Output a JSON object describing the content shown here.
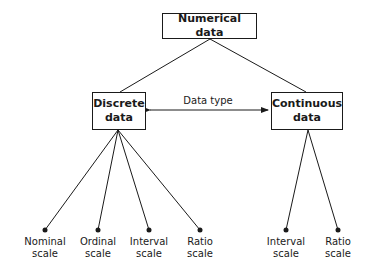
{
  "diagram": {
    "root": {
      "label": "Numerical data"
    },
    "relation_label": "Data type",
    "branches": [
      {
        "label": "Discrete data",
        "line1": "Discrete",
        "line2": "data",
        "leaves": [
          {
            "line1": "Nominal",
            "line2": "scale"
          },
          {
            "line1": "Ordinal",
            "line2": "scale"
          },
          {
            "line1": "Interval",
            "line2": "scale"
          },
          {
            "line1": "Ratio",
            "line2": "scale"
          }
        ]
      },
      {
        "label": "Continuous data",
        "line1": "Continuous",
        "line2": "data",
        "leaves": [
          {
            "line1": "Interval",
            "line2": "scale"
          },
          {
            "line1": "Ratio",
            "line2": "scale"
          }
        ]
      }
    ]
  },
  "colors": {
    "stroke": "#1a1a1a",
    "background": "#ffffff"
  }
}
